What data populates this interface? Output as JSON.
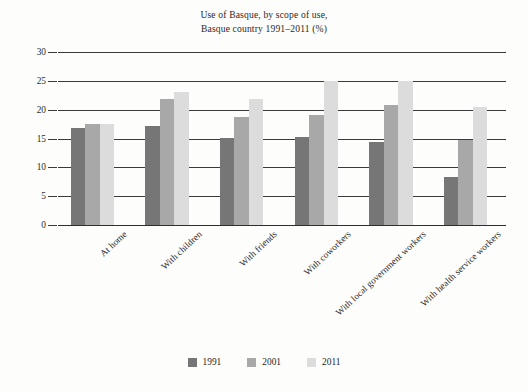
{
  "chart_data": {
    "type": "bar",
    "title_lines": [
      "Use of Basque, by scope of use,",
      "Basque country 1991–2011 (%)"
    ],
    "xlabel": "",
    "ylabel": "",
    "ylim": [
      0,
      30
    ],
    "yticks": [
      0,
      5,
      10,
      15,
      20,
      25,
      30
    ],
    "ytick_labels": [
      "0",
      "5",
      "10",
      "15",
      "20",
      "25",
      "30"
    ],
    "grid": true,
    "grid_axis": "y",
    "legend_position": "bottom",
    "categories": [
      "At home",
      "With children",
      "With friends",
      "With coworkers",
      "With local government workers",
      "With health service workers"
    ],
    "series": [
      {
        "name": "1991",
        "color": "#767676",
        "values": [
          16.8,
          17.2,
          15.1,
          15.2,
          14.4,
          8.3
        ]
      },
      {
        "name": "2001",
        "color": "#a8a8a8",
        "values": [
          17.5,
          21.8,
          18.8,
          19.0,
          20.8,
          14.7
        ]
      },
      {
        "name": "2011",
        "color": "#dcdcdc",
        "values": [
          17.5,
          23.0,
          21.8,
          25.0,
          25.0,
          20.5
        ]
      }
    ]
  },
  "legend": {
    "items": [
      {
        "label": "1991",
        "color": "#767676"
      },
      {
        "label": "2001",
        "color": "#a8a8a8"
      },
      {
        "label": "2011",
        "color": "#dcdcdc"
      }
    ]
  }
}
